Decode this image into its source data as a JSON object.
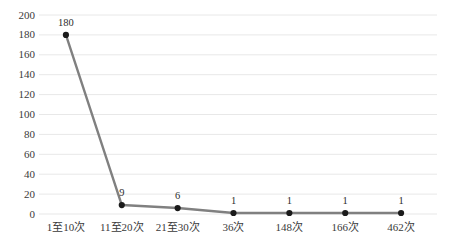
{
  "chart_data": {
    "type": "line",
    "title": "",
    "subtitle": "",
    "xlabel": "",
    "ylabel": "",
    "categories": [
      "1至10次",
      "11至20次",
      "21至30次",
      "36次",
      "148次",
      "166次",
      "462次"
    ],
    "values": [
      180,
      9,
      6,
      1,
      1,
      1,
      1
    ],
    "data_labels": [
      "180",
      "9",
      "6",
      "1",
      "1",
      "1",
      "1"
    ],
    "ylim": [
      0,
      200
    ],
    "yticks": [
      0,
      20,
      40,
      60,
      80,
      100,
      120,
      140,
      160,
      180,
      200
    ],
    "ytick_labels": [
      "0",
      "20",
      "40",
      "60",
      "80",
      "100",
      "120",
      "140",
      "160",
      "180",
      "200"
    ],
    "grid": true,
    "grid_axis": "y",
    "legend": false,
    "legend_position": "none",
    "series": [
      {
        "name": "",
        "values": [
          180,
          9,
          6,
          1,
          1,
          1,
          1
        ]
      }
    ]
  },
  "style": {
    "line_color": "#808080",
    "marker_color": "#1a1a1a",
    "grid_color": "#e8e8e8",
    "text_color": "#3a3a3a",
    "background": "#ffffff"
  }
}
